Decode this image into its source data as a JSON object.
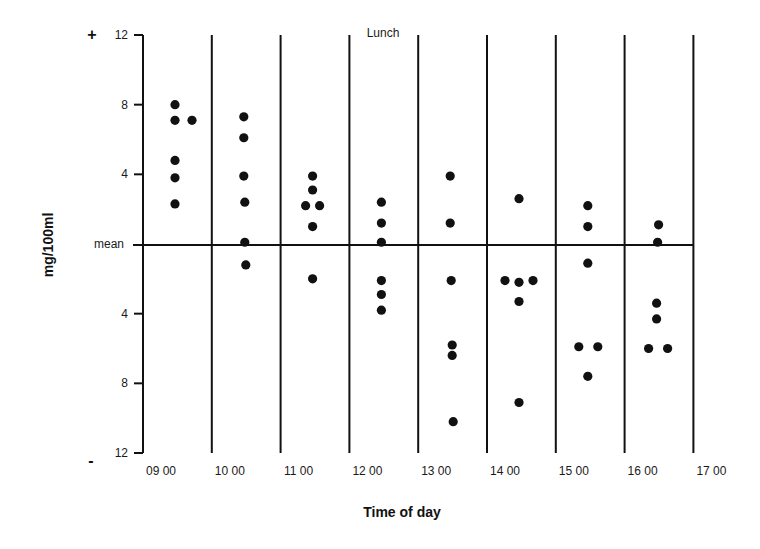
{
  "chart_data": {
    "type": "scatter",
    "title": "",
    "xlabel": "Time of day",
    "ylabel": "mg/100ml",
    "x_ticks": [
      "09 00",
      "10 00",
      "11 00",
      "12 00",
      "13 00",
      "14 00",
      "15 00",
      "16 00",
      "17 00"
    ],
    "y_ticks": [
      {
        "value": 12,
        "label": "12"
      },
      {
        "value": 8,
        "label": "8"
      },
      {
        "value": 4,
        "label": "4"
      },
      {
        "value": 0,
        "label": "mean"
      },
      {
        "value": -4,
        "label": "4"
      },
      {
        "value": -8,
        "label": "8"
      },
      {
        "value": -12,
        "label": "12"
      }
    ],
    "ylim": [
      -12,
      12
    ],
    "positive_sign": "+",
    "negative_sign": "-",
    "reference_line": {
      "value": 0,
      "label": "mean"
    },
    "annotations": [
      {
        "text": "Lunch",
        "between": [
          "12 00",
          "13 00"
        ]
      }
    ],
    "grid": "vertical lines at each hour",
    "legend": null,
    "points": [
      {
        "interval": "09 00-10 00",
        "offset": 0,
        "y": 8.0
      },
      {
        "interval": "09 00-10 00",
        "offset": 0,
        "y": 7.1
      },
      {
        "interval": "09 00-10 00",
        "offset": 17,
        "y": 7.1
      },
      {
        "interval": "09 00-10 00",
        "offset": 0,
        "y": 4.8
      },
      {
        "interval": "09 00-10 00",
        "offset": 0,
        "y": 3.8
      },
      {
        "interval": "09 00-10 00",
        "offset": 0,
        "y": 2.3
      },
      {
        "interval": "10 00-11 00",
        "offset": 0,
        "y": 7.3
      },
      {
        "interval": "10 00-11 00",
        "offset": 0,
        "y": 6.1
      },
      {
        "interval": "10 00-11 00",
        "offset": 0,
        "y": 3.9
      },
      {
        "interval": "10 00-11 00",
        "offset": 1,
        "y": 2.4
      },
      {
        "interval": "10 00-11 00",
        "offset": 1,
        "y": 0.1
      },
      {
        "interval": "10 00-11 00",
        "offset": 2,
        "y": -1.2
      },
      {
        "interval": "11 00-12 00",
        "offset": 0,
        "y": 3.9
      },
      {
        "interval": "11 00-12 00",
        "offset": 0,
        "y": 3.1
      },
      {
        "interval": "11 00-12 00",
        "offset": -7,
        "y": 2.2
      },
      {
        "interval": "11 00-12 00",
        "offset": 7,
        "y": 2.2
      },
      {
        "interval": "11 00-12 00",
        "offset": 0,
        "y": 1.0
      },
      {
        "interval": "11 00-12 00",
        "offset": 0,
        "y": -2.0
      },
      {
        "interval": "12 00-13 00",
        "offset": 0,
        "y": 2.4
      },
      {
        "interval": "12 00-13 00",
        "offset": 0,
        "y": 1.2
      },
      {
        "interval": "12 00-13 00",
        "offset": 0,
        "y": 0.1
      },
      {
        "interval": "12 00-13 00",
        "offset": 0,
        "y": -2.1
      },
      {
        "interval": "12 00-13 00",
        "offset": 0,
        "y": -2.9
      },
      {
        "interval": "12 00-13 00",
        "offset": 0,
        "y": -3.8
      },
      {
        "interval": "13 00-14 00",
        "offset": 0,
        "y": 3.9
      },
      {
        "interval": "13 00-14 00",
        "offset": 0,
        "y": 1.2
      },
      {
        "interval": "13 00-14 00",
        "offset": 1,
        "y": -2.1
      },
      {
        "interval": "13 00-14 00",
        "offset": 2,
        "y": -5.8
      },
      {
        "interval": "13 00-14 00",
        "offset": 2,
        "y": -6.4
      },
      {
        "interval": "13 00-14 00",
        "offset": 3,
        "y": -10.2
      },
      {
        "interval": "14 00-15 00",
        "offset": 0,
        "y": 2.6
      },
      {
        "interval": "14 00-15 00",
        "offset": -14,
        "y": -2.1
      },
      {
        "interval": "14 00-15 00",
        "offset": 0,
        "y": -2.2
      },
      {
        "interval": "14 00-15 00",
        "offset": 14,
        "y": -2.1
      },
      {
        "interval": "14 00-15 00",
        "offset": 0,
        "y": -3.3
      },
      {
        "interval": "14 00-15 00",
        "offset": 0,
        "y": -9.1
      },
      {
        "interval": "15 00-16 00",
        "offset": 0,
        "y": 2.2
      },
      {
        "interval": "15 00-16 00",
        "offset": 0,
        "y": 1.0
      },
      {
        "interval": "15 00-16 00",
        "offset": 0,
        "y": -1.1
      },
      {
        "interval": "15 00-16 00",
        "offset": -9,
        "y": -5.9
      },
      {
        "interval": "15 00-16 00",
        "offset": 10,
        "y": -5.9
      },
      {
        "interval": "15 00-16 00",
        "offset": 0,
        "y": -7.6
      },
      {
        "interval": "16 00-17 00",
        "offset": 2,
        "y": 1.1
      },
      {
        "interval": "16 00-17 00",
        "offset": 1,
        "y": 0.1
      },
      {
        "interval": "16 00-17 00",
        "offset": 0,
        "y": -3.4
      },
      {
        "interval": "16 00-17 00",
        "offset": 0,
        "y": -4.3
      },
      {
        "interval": "16 00-17 00",
        "offset": -8,
        "y": -6.0
      },
      {
        "interval": "16 00-17 00",
        "offset": 11,
        "y": -6.0
      }
    ]
  },
  "colors": {
    "ink": "#111111",
    "background": "#ffffff"
  }
}
